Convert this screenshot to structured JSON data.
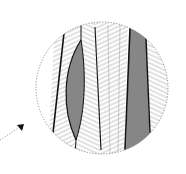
{
  "diagram": {
    "colors": {
      "background": "#ffffff",
      "outline": "#111111",
      "shaded_cell": "#8a8a8a",
      "hatch": "#9a9a9a",
      "dotted_border": "#777777"
    },
    "inset": {
      "cx": 102,
      "cy": 88,
      "r": 66
    },
    "arrow": {
      "from": [
        0,
        140
      ],
      "to": [
        23,
        124
      ]
    }
  }
}
